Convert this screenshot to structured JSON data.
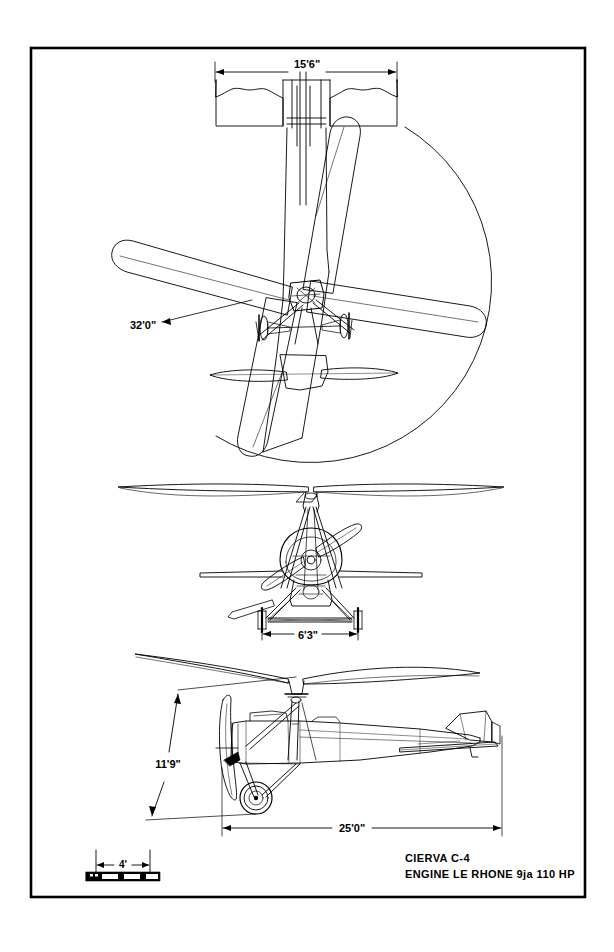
{
  "sheet": {
    "background_color": "#ffffff",
    "ink_color": "#000000",
    "border": {
      "x": 31,
      "y": 48,
      "width": 554,
      "height": 849,
      "stroke_width": 2.6
    }
  },
  "title_block": {
    "line1": "CIERVA  C-4",
    "line2": "ENGINE  LE RHONE  9ja 110 HP",
    "x": 405,
    "y_line1": 862,
    "y_line2": 878
  },
  "scale_bar": {
    "label": "4'",
    "label_x": 122,
    "label_y": 865,
    "bar": {
      "x": 86,
      "y": 872,
      "width": 74,
      "height": 9
    },
    "segments": 4,
    "tick_left_x": 96,
    "tick_right_x": 150,
    "tick_top_y": 850,
    "tick_bottom_y": 872
  },
  "views": [
    {
      "name": "plan-view",
      "label": "top / plan view",
      "dimensions": [
        {
          "name": "wing-span",
          "value": "15'6\"",
          "text_x": 307,
          "text_y": 68,
          "line_y": 72,
          "x1": 215,
          "x2": 397
        },
        {
          "name": "rotor-diameter",
          "value": "32'0\"",
          "text_x": 130,
          "text_y": 329,
          "leader_x1": 160,
          "leader_y1": 323,
          "leader_x2": 252,
          "leader_y2": 300
        }
      ]
    },
    {
      "name": "front-view",
      "label": "front elevation",
      "dimensions": [
        {
          "name": "undercarriage-track",
          "value": "6'3\"",
          "text_x": 308,
          "text_y": 639,
          "line_y": 634,
          "x1": 262,
          "x2": 358
        }
      ]
    },
    {
      "name": "side-view",
      "label": "side elevation",
      "dimensions": [
        {
          "name": "overall-height",
          "value": "11'9\"",
          "text_x": 168,
          "text_y": 768
        },
        {
          "name": "overall-length",
          "value": "25'0\"",
          "text_x": 350,
          "text_y": 832,
          "line_y": 828,
          "x1": 222,
          "x2": 487
        }
      ]
    }
  ],
  "aircraft": {
    "designation": "CIERVA C-4",
    "engine": "LE RHONE 9ja 110 HP",
    "rotor_blades": 4,
    "rotor_diameter": "32'0\"",
    "wing_span": "15'6\"",
    "length": "25'0\"",
    "height": "11'9\"",
    "track": "6'3\""
  }
}
